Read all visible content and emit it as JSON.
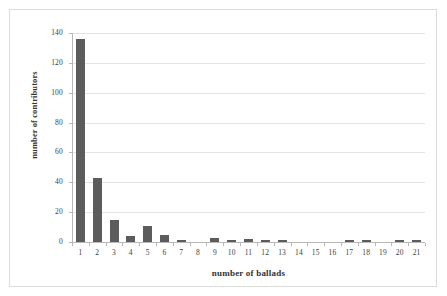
{
  "chart_data": {
    "type": "bar",
    "title": "",
    "subtitle": "",
    "xlabel": "number of ballads",
    "ylabel": "number of contributors",
    "categories": [
      "1",
      "2",
      "3",
      "4",
      "5",
      "6",
      "7",
      "8",
      "9",
      "10",
      "11",
      "12",
      "13",
      "14",
      "15",
      "16",
      "17",
      "18",
      "19",
      "20",
      "21"
    ],
    "values": [
      136,
      43,
      15,
      4,
      11,
      5,
      1,
      0,
      3,
      1,
      2,
      1,
      1,
      0,
      0,
      0,
      1,
      1,
      0,
      1,
      1
    ],
    "series": [
      {
        "name": "number of contributors",
        "values": [
          136,
          43,
          15,
          4,
          11,
          5,
          1,
          0,
          3,
          1,
          2,
          1,
          1,
          0,
          0,
          0,
          1,
          1,
          0,
          1,
          1
        ]
      }
    ],
    "ylim": [
      0,
      140
    ],
    "y_ticks": [
      0,
      20,
      40,
      60,
      80,
      100,
      120,
      140
    ],
    "y_ticklabels": [
      "0",
      "20",
      "40",
      "60",
      "80",
      "100",
      "120",
      "140"
    ],
    "grid": "horizontal",
    "legend": "none",
    "bar_color": "#5c5c5c",
    "gridline_color": "#e3e3e3",
    "axis_color": "#b8b8b8",
    "frame_color": "#dcdcdc",
    "background": "#ffffff"
  }
}
